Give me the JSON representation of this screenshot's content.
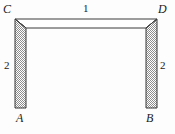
{
  "figure": {
    "vertex_labels": [
      {
        "id": "C",
        "text": "C",
        "position": "top-left"
      },
      {
        "id": "D",
        "text": "D",
        "position": "top-right"
      },
      {
        "id": "A",
        "text": "A",
        "position": "bottom-left"
      },
      {
        "id": "B",
        "text": "B",
        "position": "bottom-right"
      }
    ],
    "dimensions": [
      {
        "id": "top",
        "text": "1",
        "edge": "CD",
        "position": "above-top-beam"
      },
      {
        "id": "left",
        "text": "2",
        "edge": "CA",
        "position": "left-of-left-leg"
      },
      {
        "id": "right",
        "text": "2",
        "edge": "DB",
        "position": "right-of-right-leg"
      }
    ],
    "style": {
      "outline_color": "#3a3a3a",
      "leg_fill": "#9a9a9a",
      "beam_fill": "#ffffff",
      "background": "#fdfdfd",
      "label_color": "#1b1b1b"
    },
    "geometry": {
      "outer_left": 15,
      "outer_right": 157,
      "outer_top": 19,
      "leg_bottom": 108,
      "beam_bottom": 28,
      "leg_width": 11
    }
  }
}
